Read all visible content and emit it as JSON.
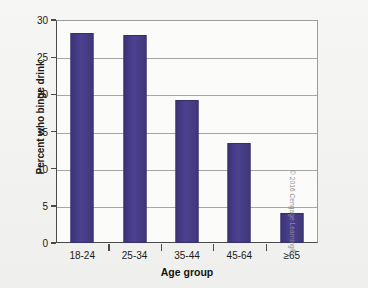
{
  "chart_data": {
    "type": "bar",
    "title": "",
    "xlabel": "Age group",
    "ylabel": "Percent who binge drink",
    "categories": [
      "18-24",
      "25-34",
      "35-44",
      "45-64",
      "≥65"
    ],
    "values": [
      28.2,
      28.0,
      19.2,
      13.4,
      4.0
    ],
    "ylim": [
      0,
      30
    ],
    "yticks": [
      0,
      5,
      10,
      15,
      20,
      25,
      30
    ],
    "ytick_labels": [
      "0",
      "5",
      "10",
      "15",
      "20",
      "25",
      "30"
    ],
    "grid": true,
    "legend": false,
    "bar_color": "#423983",
    "series": [
      {
        "name": "Percent who binge drink",
        "values": [
          28.2,
          28.0,
          19.2,
          13.4,
          4.0
        ]
      }
    ]
  },
  "figure": {
    "background_color": "#f2f2f0",
    "plot_background_color": "#fbfbfa",
    "axis_color": "#4a4a4a",
    "gridline_color": "#a6a6a6"
  },
  "credit": {
    "text": "© 2016 Cengage Learning®"
  }
}
